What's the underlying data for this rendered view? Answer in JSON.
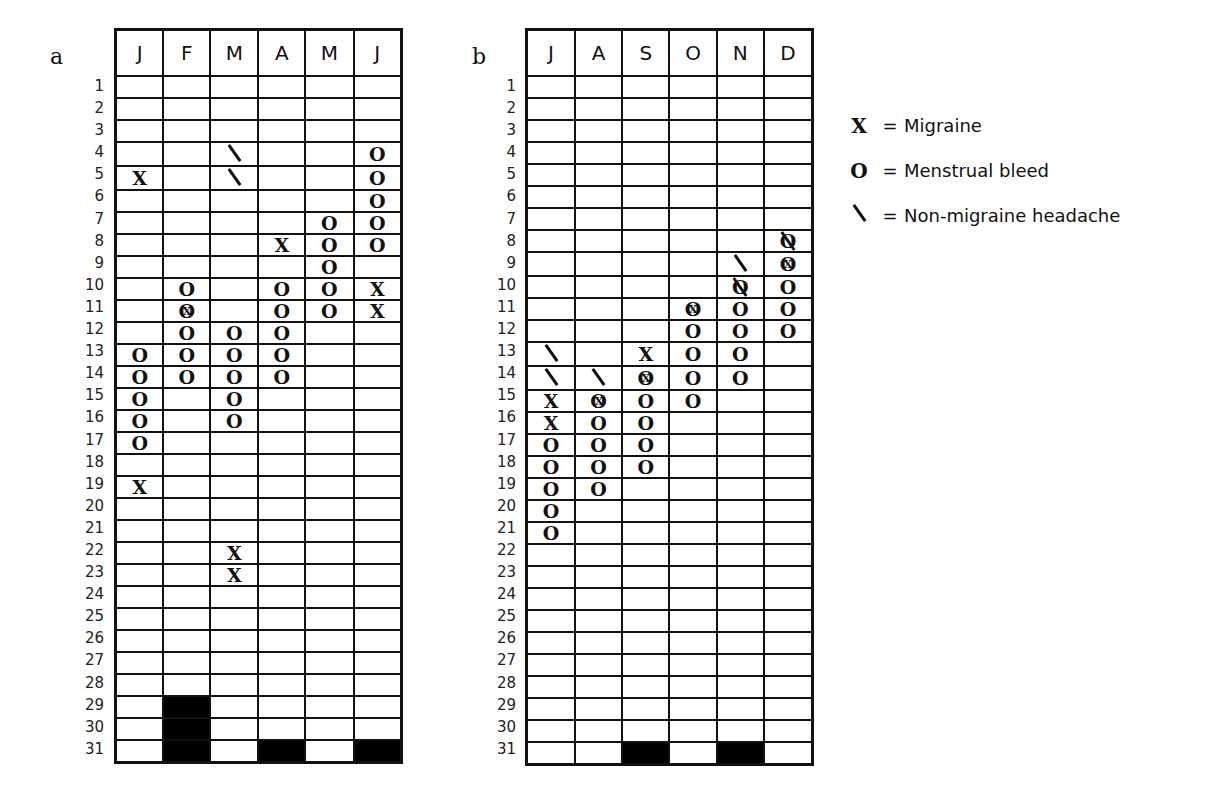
{
  "chart_data": [
    {
      "type": "table",
      "panel": "a",
      "title": "a",
      "columns": [
        "J",
        "F",
        "M",
        "A",
        "M",
        "J"
      ],
      "rows": 31,
      "days_in_month": [
        31,
        28,
        31,
        30,
        31,
        30
      ],
      "events": {
        "J": {
          "migraine": [
            5,
            19
          ],
          "menstrual": [
            13,
            14,
            15,
            16,
            17
          ],
          "non_migraine": []
        },
        "F": {
          "migraine": [
            11
          ],
          "menstrual": [
            10,
            11,
            12,
            13,
            14
          ],
          "non_migraine": []
        },
        "M": {
          "migraine": [
            22,
            23
          ],
          "menstrual": [
            12,
            13,
            14,
            15,
            16
          ],
          "non_migraine": [
            4,
            5
          ]
        },
        "A": {
          "migraine": [
            8
          ],
          "menstrual": [
            10,
            11,
            12,
            13,
            14
          ],
          "non_migraine": []
        },
        "M2": {
          "migraine": [],
          "menstrual": [
            7,
            8,
            9,
            10,
            11
          ],
          "non_migraine": []
        },
        "J2": {
          "migraine": [
            10,
            11
          ],
          "menstrual": [
            4,
            5,
            6,
            7,
            8
          ],
          "non_migraine": []
        }
      }
    },
    {
      "type": "table",
      "panel": "b",
      "title": "b",
      "columns": [
        "J",
        "A",
        "S",
        "O",
        "N",
        "D"
      ],
      "rows": 31,
      "days_in_month": [
        31,
        31,
        30,
        31,
        30,
        31
      ],
      "events": {
        "J": {
          "migraine": [
            15,
            16
          ],
          "menstrual": [
            17,
            18,
            19,
            20,
            21
          ],
          "non_migraine": [
            13,
            14
          ]
        },
        "A": {
          "migraine": [
            15
          ],
          "menstrual": [
            15,
            16,
            17,
            18,
            19
          ],
          "non_migraine": [
            14
          ]
        },
        "S": {
          "migraine": [
            13,
            14
          ],
          "menstrual": [
            14,
            15,
            16,
            17,
            18
          ],
          "non_migraine": []
        },
        "O": {
          "migraine": [
            11
          ],
          "menstrual": [
            11,
            12,
            13,
            14,
            15
          ],
          "non_migraine": []
        },
        "N": {
          "migraine": [],
          "menstrual": [
            10,
            11,
            12,
            13,
            14
          ],
          "non_migraine": [
            9,
            10
          ]
        },
        "D": {
          "migraine": [
            9
          ],
          "menstrual": [
            8,
            9,
            10,
            11,
            12
          ],
          "non_migraine": [
            8
          ]
        }
      }
    }
  ],
  "panels": {
    "a": {
      "label": "a",
      "months": [
        "J",
        "F",
        "M",
        "A",
        "M",
        "J"
      ],
      "blocked_from": [
        32,
        29,
        32,
        31,
        32,
        31
      ],
      "cells": [
        {
          "5": "X",
          "13": "O",
          "14": "O",
          "15": "O",
          "16": "O",
          "17": "O",
          "19": "X"
        },
        {
          "10": "O",
          "11": "XO",
          "12": "O",
          "13": "O",
          "14": "O"
        },
        {
          "4": "\\",
          "5": "\\",
          "12": "O",
          "13": "O",
          "14": "O",
          "15": "O",
          "16": "O",
          "22": "X",
          "23": "X"
        },
        {
          "8": "X",
          "10": "O",
          "11": "O",
          "12": "O",
          "13": "O",
          "14": "O"
        },
        {
          "7": "O",
          "8": "O",
          "9": "O",
          "10": "O",
          "11": "O"
        },
        {
          "4": "O",
          "5": "O",
          "6": "O",
          "7": "O",
          "8": "O",
          "10": "X",
          "11": "X"
        }
      ]
    },
    "b": {
      "label": "b",
      "months": [
        "J",
        "A",
        "S",
        "O",
        "N",
        "D"
      ],
      "blocked_from": [
        32,
        32,
        31,
        32,
        31,
        32
      ],
      "cells": [
        {
          "13": "\\",
          "14": "\\",
          "15": "X",
          "16": "X",
          "17": "O",
          "18": "O",
          "19": "O",
          "20": "O",
          "21": "O"
        },
        {
          "14": "\\",
          "15": "XO",
          "16": "O",
          "17": "O",
          "18": "O",
          "19": "O"
        },
        {
          "13": "X",
          "14": "XO",
          "15": "O",
          "16": "O",
          "17": "O",
          "18": "O"
        },
        {
          "11": "XO",
          "12": "O",
          "13": "O",
          "14": "O",
          "15": "O"
        },
        {
          "9": "\\",
          "10": "O\\",
          "11": "O",
          "12": "O",
          "13": "O",
          "14": "O"
        },
        {
          "8": "O\\",
          "9": "XO",
          "10": "O",
          "11": "O",
          "12": "O"
        }
      ]
    }
  },
  "legend": [
    {
      "symbol": "X",
      "eq": "=",
      "label": "Migraine"
    },
    {
      "symbol": "O",
      "eq": "=",
      "label": "Menstrual bleed"
    },
    {
      "symbol": "\\",
      "eq": "=",
      "label": "Non-migraine headache"
    }
  ]
}
